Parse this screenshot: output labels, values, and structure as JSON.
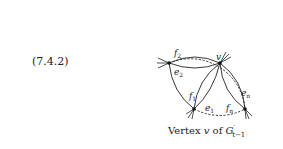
{
  "equation_number": "(7.4.2)",
  "caption": {
    "prefix": "Vertex",
    "vertex": "v",
    "of": "of",
    "graph": "G",
    "graph_sub": "t−1",
    "prime": "′"
  },
  "diagram": {
    "vertices": [
      {
        "id": "v",
        "label": "v"
      },
      {
        "id": "left",
        "label": ""
      },
      {
        "id": "bottom-left",
        "label": ""
      },
      {
        "id": "bottom-right",
        "label": ""
      }
    ],
    "edge_labels": {
      "f2": {
        "base": "f",
        "sub": "2"
      },
      "e2": {
        "base": "e",
        "sub": "2"
      },
      "f1": {
        "base": "f",
        "sub": "1"
      },
      "e1": {
        "base": "e",
        "sub": "1"
      },
      "fn": {
        "base": "f",
        "sub": "n"
      },
      "en": {
        "base": "e",
        "sub": "n"
      }
    }
  }
}
